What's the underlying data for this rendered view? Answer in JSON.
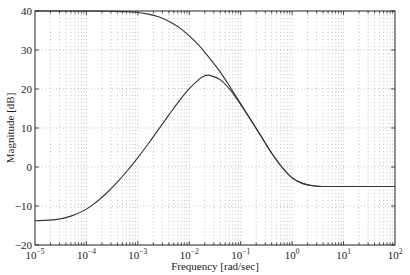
{
  "chart_data": {
    "type": "line",
    "title": "",
    "xlabel": "Frequency [rad/sec]",
    "ylabel": "Magnitude [dB]",
    "xscale": "log",
    "xlim": [
      1e-05,
      100
    ],
    "ylim": [
      -20,
      40
    ],
    "grid": true,
    "legend": null,
    "x_ticks": [
      {
        "value": -5,
        "label": "10",
        "exp": "-5"
      },
      {
        "value": -4,
        "label": "10",
        "exp": "-4"
      },
      {
        "value": -3,
        "label": "10",
        "exp": "-3"
      },
      {
        "value": -2,
        "label": "10",
        "exp": "-2"
      },
      {
        "value": -1,
        "label": "10",
        "exp": "-1"
      },
      {
        "value": 0,
        "label": "10",
        "exp": "0"
      },
      {
        "value": 1,
        "label": "10",
        "exp": "1"
      },
      {
        "value": 2,
        "label": "10",
        "exp": "2"
      }
    ],
    "y_ticks": [
      -20,
      -10,
      0,
      10,
      20,
      30,
      40
    ],
    "series": [
      {
        "name": "upper",
        "color": "#333333",
        "log10_x": [
          -5,
          -4,
          -3.5,
          -3.2,
          -3.0,
          -2.8,
          -2.6,
          -2.4,
          -2.2,
          -2.0,
          -1.8,
          -1.6,
          -1.4,
          -1.2,
          -1.0,
          -0.8,
          -0.6,
          -0.4,
          -0.2,
          0.0,
          0.2,
          0.4,
          0.6,
          0.8,
          1.0,
          1.5,
          2.0
        ],
        "y": [
          40,
          40,
          39.9,
          39.8,
          39.6,
          39.2,
          38.5,
          37.4,
          35.8,
          33.6,
          31.0,
          27.8,
          24.4,
          20.4,
          16.2,
          12.0,
          7.8,
          3.6,
          0.0,
          -2.8,
          -4.2,
          -4.8,
          -5.0,
          -5.0,
          -5.0,
          -5.0,
          -5.0
        ]
      },
      {
        "name": "lower",
        "color": "#333333",
        "log10_x": [
          -5,
          -4.6,
          -4.3,
          -4.0,
          -3.8,
          -3.6,
          -3.4,
          -3.2,
          -3.0,
          -2.8,
          -2.6,
          -2.4,
          -2.2,
          -2.0,
          -1.8,
          -1.7,
          -1.6,
          -1.4,
          -1.2,
          -1.0,
          -0.8,
          -0.6,
          -0.4,
          -0.2,
          0.0,
          0.2,
          0.4,
          0.6,
          0.8,
          1.0,
          1.5,
          2.0
        ],
        "y": [
          -13.8,
          -13.5,
          -12.6,
          -10.8,
          -8.9,
          -6.6,
          -3.9,
          -0.9,
          2.4,
          5.9,
          9.6,
          13.3,
          16.9,
          20.1,
          22.6,
          23.4,
          23.5,
          22.4,
          19.7,
          16.0,
          12.0,
          7.8,
          3.6,
          0.0,
          -2.8,
          -4.2,
          -4.8,
          -5.0,
          -5.0,
          -5.0,
          -5.0,
          -5.0
        ]
      }
    ]
  }
}
